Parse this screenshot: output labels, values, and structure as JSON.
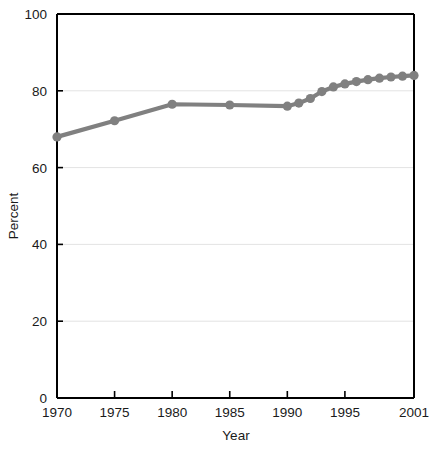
{
  "chart_data": {
    "type": "line",
    "title": "",
    "xlabel": "Year",
    "ylabel": "Percent",
    "xlim": [
      1970,
      2001
    ],
    "ylim": [
      0,
      100
    ],
    "grid": true,
    "legend": "none",
    "series_color": "#808080",
    "axis_color": "#000000",
    "grid_color": "#e3e3e3",
    "x_ticks": [
      "1970",
      "1975",
      "1980",
      "1985",
      "1990",
      "1995",
      "2001"
    ],
    "x_tick_values": [
      1970,
      1975,
      1980,
      1985,
      1990,
      1995,
      2001
    ],
    "y_ticks": [
      "0",
      "20",
      "40",
      "60",
      "80",
      "100"
    ],
    "y_tick_values": [
      0,
      20,
      40,
      60,
      80,
      100
    ],
    "x": [
      1970,
      1975,
      1980,
      1985,
      1990,
      1991,
      1992,
      1993,
      1994,
      1995,
      1996,
      1997,
      1998,
      1999,
      2000,
      2001
    ],
    "values": [
      68.0,
      72.2,
      76.5,
      76.3,
      76.0,
      76.8,
      78.0,
      79.8,
      81.0,
      81.8,
      82.4,
      82.9,
      83.3,
      83.6,
      83.8,
      84.0
    ]
  }
}
